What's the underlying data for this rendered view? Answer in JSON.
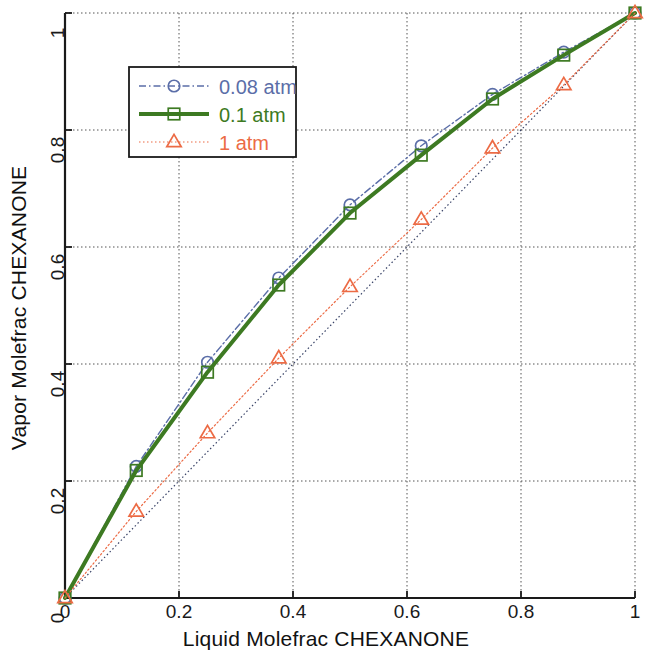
{
  "chart_data": {
    "type": "line",
    "title": "",
    "xlabel": "Liquid Molefrac CHEXANONE",
    "ylabel": "Vapor Molefrac CHEXANONE",
    "xlim": [
      0,
      1
    ],
    "ylim": [
      0,
      1
    ],
    "xticks": [
      "0",
      "0.2",
      "0.4",
      "0.6",
      "0.8",
      "1"
    ],
    "xtick_values": [
      0,
      0.2,
      0.4,
      0.6,
      0.8,
      1
    ],
    "yticks": [
      "0",
      "0.2",
      "0.4",
      "0.6",
      "0.8",
      "1"
    ],
    "ytick_values": [
      0,
      0.2,
      0.4,
      0.6,
      0.8,
      1
    ],
    "grid": true,
    "grid_style": "dotted",
    "legend_position": "upper-left",
    "x": [
      0,
      0.125,
      0.25,
      0.375,
      0.5,
      0.625,
      0.75,
      0.875,
      1
    ],
    "series": [
      {
        "name": "0.08 atm",
        "color": "#5b6ea8",
        "marker": "circle",
        "linestyle": "dashdot",
        "linewidth": 1.4,
        "values": [
          0,
          0.225,
          0.403,
          0.547,
          0.672,
          0.773,
          0.861,
          0.933,
          1
        ]
      },
      {
        "name": "0.1 atm",
        "color": "#3d7a22",
        "marker": "square",
        "linestyle": "solid",
        "linewidth": 4,
        "values": [
          0,
          0.218,
          0.386,
          0.535,
          0.658,
          0.757,
          0.853,
          0.928,
          1
        ]
      },
      {
        "name": "1 atm",
        "color": "#ec6b45",
        "marker": "triangle",
        "linestyle": "dotted",
        "linewidth": 1.2,
        "values": [
          0,
          0.148,
          0.282,
          0.41,
          0.532,
          0.647,
          0.769,
          0.877,
          1
        ]
      }
    ],
    "reference_line": {
      "name": "y = x diagonal",
      "color": "#3a4468",
      "linestyle": "dotted",
      "x": [
        0,
        1
      ],
      "values": [
        0,
        1
      ]
    }
  },
  "legend": {
    "entries": [
      {
        "label": "0.08 atm",
        "color": "#5b6ea8"
      },
      {
        "label": "0.1 atm",
        "color": "#3d7a22"
      },
      {
        "label": "1 atm",
        "color": "#ec6b45"
      }
    ]
  },
  "axes": {
    "x_label": "Liquid Molefrac CHEXANONE",
    "y_label": "Vapor Molefrac CHEXANONE",
    "x_tick_labels": [
      "0",
      "0.2",
      "0.4",
      "0.6",
      "0.8",
      "1"
    ],
    "y_tick_labels": [
      "0",
      "0.2",
      "0.4",
      "0.6",
      "0.8",
      "1"
    ],
    "axis_color": "#1a1a1a",
    "grid_color": "#555555"
  }
}
